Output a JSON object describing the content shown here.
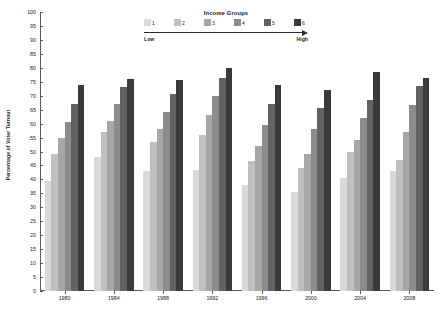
{
  "chart_data": {
    "type": "bar",
    "title": "",
    "xlabel": "",
    "ylabel": "Percentage of Voter Turnout",
    "ylim": [
      0,
      100
    ],
    "ytick_step": 5,
    "grid": false,
    "legend_position": "top-center",
    "categories": [
      "1980",
      "1984",
      "1988",
      "1992",
      "1996",
      "2000",
      "2004",
      "2008"
    ],
    "yticks": [
      "100",
      "95",
      "90",
      "85",
      "80",
      "75",
      "70",
      "65",
      "60",
      "55",
      "50",
      "45",
      "40",
      "35",
      "30",
      "25",
      "20",
      "15",
      "10",
      "5",
      "0"
    ],
    "series": [
      {
        "name": "1",
        "color": "#d9d9d9",
        "values": [
          39.5,
          48.0,
          43.0,
          43.5,
          38.0,
          35.5,
          40.5,
          43.0
        ]
      },
      {
        "name": "2",
        "color": "#bfbfbf",
        "values": [
          49.0,
          57.0,
          53.5,
          56.0,
          46.5,
          44.0,
          50.0,
          47.0
        ]
      },
      {
        "name": "3",
        "color": "#a6a6a6",
        "values": [
          55.0,
          61.0,
          58.0,
          63.0,
          52.0,
          49.0,
          54.0,
          57.0
        ]
      },
      {
        "name": "4",
        "color": "#8c8c8c",
        "values": [
          60.5,
          67.0,
          64.0,
          70.0,
          59.5,
          58.0,
          62.0,
          66.5
        ]
      },
      {
        "name": "5",
        "color": "#626262",
        "values": [
          67.0,
          73.0,
          70.5,
          76.5,
          67.0,
          65.5,
          68.5,
          73.5
        ]
      },
      {
        "name": "6",
        "color": "#3a3a3a",
        "values": [
          74.0,
          76.0,
          75.5,
          80.0,
          74.0,
          72.0,
          78.5,
          76.5
        ]
      }
    ],
    "legend": {
      "title": "Income Groups",
      "low_label": "Low",
      "high_label": "High",
      "entries": [
        "1",
        "2",
        "3",
        "4",
        "5",
        "6"
      ]
    }
  }
}
